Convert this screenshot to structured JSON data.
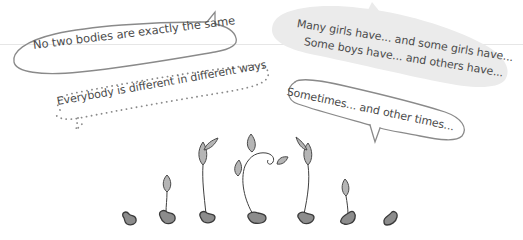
{
  "bubbles": {
    "outline_top": {
      "text": "No two bodies are exactly the same",
      "style": "outline"
    },
    "dotted_left": {
      "text": "Everybody is different in different ways",
      "style": "dotted"
    },
    "filled_right": {
      "line1": "Many girls have... and some girls have...",
      "line2": "Some boys have... and others have...",
      "style": "filled"
    },
    "outline_right": {
      "text": "Sometimes... and other times...",
      "style": "outline"
    }
  },
  "sprouts": {
    "count": 7,
    "stages": [
      "seed",
      "small-sprout",
      "tall-sprout",
      "curled-vine",
      "tall-sprout",
      "small-sprout",
      "seed"
    ]
  },
  "colors": {
    "text": "#4a4a4a",
    "outline": "#8a8a8a",
    "bubble_fill": "#ebebeb",
    "seed_fill": "#8c8c8c",
    "seed_stroke": "#3a3a3a",
    "leaf_fill": "#b5b5b5",
    "stem": "#3f3f3f"
  }
}
